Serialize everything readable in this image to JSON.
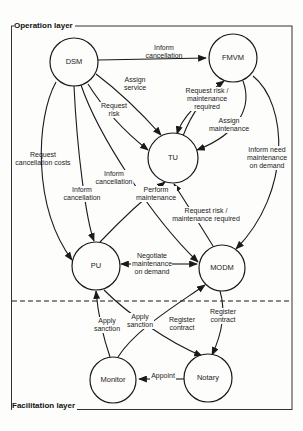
{
  "colors": {
    "background": "#fdfdfc",
    "line": "#1a1a1a",
    "text": "#222222"
  },
  "layers": {
    "operation": "Operation layer",
    "facilitation": "Facilitation layer"
  },
  "nodes": [
    {
      "id": "dsm",
      "label": "DSM"
    },
    {
      "id": "fmvm",
      "label": "FMVM"
    },
    {
      "id": "tu",
      "label": "TU"
    },
    {
      "id": "pu",
      "label": "PU"
    },
    {
      "id": "modm",
      "label": "MODM"
    },
    {
      "id": "monitor",
      "label": "Monitor"
    },
    {
      "id": "notary",
      "label": "Notary"
    }
  ],
  "edge_labels": [
    {
      "id": "inform-cancellation-dsm-fmvm",
      "label": "Inform\ncancellation"
    },
    {
      "id": "assign-service",
      "label": "Assign\nservice"
    },
    {
      "id": "request-risk",
      "label": "Request\nrisk"
    },
    {
      "id": "request-risk-maintenance-required-tu-fmvm",
      "label": "Request risk /\nmaintenance\nrequired"
    },
    {
      "id": "assign-maintenance",
      "label": "Assign\nmaintenance"
    },
    {
      "id": "inform-need-maintenance-on-demand",
      "label": "Inform need\nmaintenance\non demand"
    },
    {
      "id": "request-cancellation-costs",
      "label": "Request\ncancellation costs"
    },
    {
      "id": "inform-cancellation-dsm-pu",
      "label": "Inform\ncancellation"
    },
    {
      "id": "inform-cancellation-dsm-modm",
      "label": "Inform\ncancellation"
    },
    {
      "id": "perform-maintenance",
      "label": "Perform\nmaintenance"
    },
    {
      "id": "request-risk-maintenance-required-modm-tu",
      "label": "Request risk /\nmaintenance required"
    },
    {
      "id": "negotiate-maintenance-on-demand",
      "label": "Negotiate\nmaintenance\non demand"
    },
    {
      "id": "apply-sanction-pu",
      "label": "Apply\nsanction"
    },
    {
      "id": "apply-sanction-modm",
      "label": "Apply\nsanction"
    },
    {
      "id": "register-contract-pu",
      "label": "Register\ncontract"
    },
    {
      "id": "register-contract-modm",
      "label": "Register\ncontract"
    },
    {
      "id": "appoint",
      "label": "Appoint"
    }
  ]
}
